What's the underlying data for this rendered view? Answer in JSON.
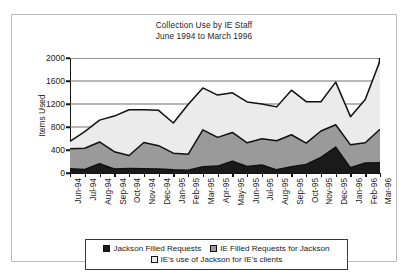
{
  "figure": {
    "title_line1": "Collection Use by IE Staff",
    "title_line2": "June 1994 to March 1996"
  },
  "axes": {
    "ylabel": "Items Used",
    "yticks": [
      "0",
      "400",
      "800",
      "1200",
      "1600",
      "2000"
    ]
  },
  "legend": {
    "items": [
      {
        "label": "Jackson Filled Requests",
        "color": "#1a1a1a"
      },
      {
        "label": "IE Filled Requests for Jackson",
        "color": "#9a9a9a"
      },
      {
        "label": "IE's use of Jackson for IE's clients",
        "color": "#ebebeb"
      }
    ]
  },
  "chart_data": {
    "type": "area",
    "stacked": true,
    "title": "Collection Use by IE Staff June 1994 to March 1996",
    "xlabel": "",
    "ylabel": "Items Used",
    "ylim": [
      0,
      2000
    ],
    "ytick_step": 400,
    "grid": true,
    "grid_axis": "y",
    "legend_position": "bottom",
    "categories": [
      "Jun-94",
      "Jul-94",
      "Aug-94",
      "Sep-94",
      "Oct-94",
      "Nov-94",
      "Dec-94",
      "Jan-95",
      "Feb-95",
      "Mar-95",
      "Apr-95",
      "May-95",
      "Jun-95",
      "Jul-95",
      "Aug-95",
      "Sep-95",
      "Oct-95",
      "Nov-95",
      "Dec-95",
      "Jan-96",
      "Feb-96",
      "Mar-96"
    ],
    "series": [
      {
        "name": "Jackson Filled Requests",
        "color": "#1a1a1a",
        "values": [
          75,
          60,
          160,
          70,
          80,
          75,
          70,
          55,
          50,
          110,
          120,
          205,
          115,
          140,
          55,
          110,
          150,
          270,
          450,
          90,
          175,
          180
        ]
      },
      {
        "name": "IE Filled Requests for Jackson",
        "color": "#9a9a9a",
        "values": [
          345,
          370,
          380,
          300,
          225,
          455,
          405,
          290,
          275,
          640,
          500,
          500,
          410,
          455,
          505,
          555,
          370,
          460,
          390,
          400,
          350,
          580
        ]
      },
      {
        "name": "IE's use of Jackson for IE's clients",
        "color": "#ebebeb",
        "values": [
          130,
          290,
          380,
          620,
          795,
          570,
          615,
          525,
          865,
          730,
          735,
          690,
          710,
          605,
          590,
          775,
          720,
          510,
          740,
          490,
          755,
          1190
        ]
      }
    ],
    "stack_top_totals": [
      550,
      720,
      920,
      990,
      1100,
      1100,
      1090,
      870,
      1190,
      1480,
      1355,
      1395,
      1235,
      1200,
      1150,
      1440,
      1240,
      1240,
      1580,
      980,
      1280,
      1950
    ],
    "stack_mid_tops": [
      420,
      430,
      540,
      370,
      305,
      530,
      475,
      345,
      325,
      750,
      620,
      705,
      525,
      595,
      560,
      665,
      520,
      730,
      840,
      490,
      525,
      760
    ]
  }
}
